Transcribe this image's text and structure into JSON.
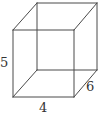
{
  "figure": {
    "type": "rectangular prism wireframe",
    "labels": {
      "height": "5",
      "width": "4",
      "depth": "6"
    },
    "colors": {
      "edge": "#4a4a4a",
      "text": "#333333",
      "background": "#ffffff"
    }
  }
}
